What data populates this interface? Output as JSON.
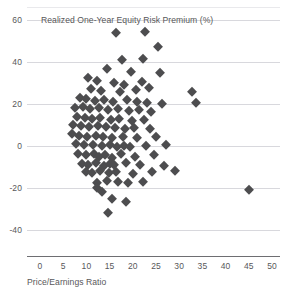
{
  "chart_data": {
    "type": "scatter",
    "title": "Realized One-Year Equity Risk Premium (%)",
    "xlabel": "Price/Earnings Ratio",
    "ylabel": "Realized One-Year Equity Risk Premium (%)",
    "xlim": [
      0,
      50
    ],
    "ylim": [
      -48,
      62
    ],
    "xticks": [
      "0",
      "5",
      "10",
      "15",
      "20",
      "25",
      "30",
      "35",
      "40",
      "45",
      "50"
    ],
    "xtick_values": [
      0,
      5,
      10,
      15,
      20,
      25,
      30,
      35,
      40,
      45,
      50
    ],
    "yticks": [
      "60",
      "40",
      "20",
      "0",
      "-20",
      "-40"
    ],
    "ytick_values": [
      60,
      40,
      20,
      0,
      -20,
      -40
    ],
    "grid": "horizontal",
    "legend": "none",
    "marker": "diamond",
    "marker_color": "#4d4d4f",
    "points": [
      [
        16.4,
        54.0
      ],
      [
        22.6,
        54.5
      ],
      [
        25.4,
        47.0
      ],
      [
        17.6,
        41.0
      ],
      [
        22.2,
        41.5
      ],
      [
        14.4,
        36.5
      ],
      [
        19.6,
        35.5
      ],
      [
        25.8,
        35.0
      ],
      [
        10.4,
        32.5
      ],
      [
        12.2,
        31.0
      ],
      [
        16.0,
        30.0
      ],
      [
        18.2,
        29.0
      ],
      [
        22.0,
        30.5
      ],
      [
        11.0,
        27.0
      ],
      [
        13.2,
        26.0
      ],
      [
        17.2,
        25.5
      ],
      [
        20.6,
        26.5
      ],
      [
        23.4,
        27.5
      ],
      [
        8.6,
        23.0
      ],
      [
        9.8,
        22.5
      ],
      [
        11.8,
        21.5
      ],
      [
        13.8,
        22.0
      ],
      [
        15.8,
        21.0
      ],
      [
        18.8,
        22.0
      ],
      [
        20.8,
        21.0
      ],
      [
        23.0,
        20.5
      ],
      [
        26.2,
        20.0
      ],
      [
        32.8,
        25.5
      ],
      [
        33.6,
        20.5
      ],
      [
        7.6,
        18.0
      ],
      [
        9.2,
        18.5
      ],
      [
        10.8,
        17.5
      ],
      [
        12.8,
        18.0
      ],
      [
        14.6,
        17.0
      ],
      [
        16.8,
        17.5
      ],
      [
        19.2,
        16.5
      ],
      [
        21.4,
        17.0
      ],
      [
        24.0,
        16.0
      ],
      [
        8.0,
        14.0
      ],
      [
        9.6,
        13.5
      ],
      [
        11.2,
        13.0
      ],
      [
        13.0,
        13.5
      ],
      [
        15.2,
        12.5
      ],
      [
        17.0,
        13.0
      ],
      [
        19.8,
        12.0
      ],
      [
        22.4,
        12.5
      ],
      [
        7.2,
        10.0
      ],
      [
        8.8,
        9.5
      ],
      [
        10.6,
        9.0
      ],
      [
        12.4,
        9.5
      ],
      [
        14.2,
        9.0
      ],
      [
        16.2,
        8.5
      ],
      [
        18.4,
        8.0
      ],
      [
        20.2,
        8.5
      ],
      [
        23.8,
        8.0
      ],
      [
        6.8,
        5.5
      ],
      [
        8.4,
        5.0
      ],
      [
        10.2,
        4.5
      ],
      [
        12.0,
        5.0
      ],
      [
        13.6,
        4.5
      ],
      [
        15.4,
        4.0
      ],
      [
        17.8,
        4.5
      ],
      [
        21.0,
        4.0
      ],
      [
        25.0,
        4.5
      ],
      [
        7.8,
        1.0
      ],
      [
        9.4,
        0.5
      ],
      [
        11.4,
        0.5
      ],
      [
        13.4,
        0.0
      ],
      [
        15.0,
        0.5
      ],
      [
        16.6,
        -0.5
      ],
      [
        18.0,
        0.0
      ],
      [
        19.4,
        -0.5
      ],
      [
        22.8,
        0.0
      ],
      [
        27.2,
        0.5
      ],
      [
        8.2,
        -4.0
      ],
      [
        10.0,
        -4.5
      ],
      [
        11.6,
        -4.0
      ],
      [
        12.6,
        -5.0
      ],
      [
        14.0,
        -4.5
      ],
      [
        15.6,
        -5.5
      ],
      [
        17.4,
        -4.0
      ],
      [
        20.4,
        -5.0
      ],
      [
        24.6,
        -4.5
      ],
      [
        9.0,
        -8.5
      ],
      [
        10.4,
        -9.0
      ],
      [
        12.0,
        -8.0
      ],
      [
        13.8,
        -9.5
      ],
      [
        15.0,
        -8.5
      ],
      [
        16.0,
        -9.0
      ],
      [
        18.6,
        -8.0
      ],
      [
        21.6,
        -9.0
      ],
      [
        26.8,
        -9.5
      ],
      [
        9.8,
        -12.5
      ],
      [
        11.2,
        -13.0
      ],
      [
        13.0,
        -12.0
      ],
      [
        14.8,
        -13.0
      ],
      [
        16.4,
        -12.5
      ],
      [
        20.0,
        -13.5
      ],
      [
        24.2,
        -12.5
      ],
      [
        29.0,
        -12.0
      ],
      [
        12.2,
        -17.5
      ],
      [
        14.4,
        -16.5
      ],
      [
        16.8,
        -17.0
      ],
      [
        19.0,
        -17.5
      ],
      [
        22.2,
        -17.0
      ],
      [
        12.2,
        -20.0
      ],
      [
        13.4,
        -22.0
      ],
      [
        45.0,
        -21.0
      ],
      [
        15.4,
        -25.0
      ],
      [
        18.6,
        -26.5
      ],
      [
        14.6,
        -32.0
      ]
    ]
  }
}
